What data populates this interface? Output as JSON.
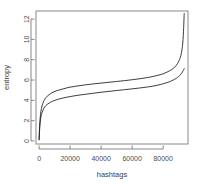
{
  "chart_data": {
    "type": "line",
    "title": "",
    "subtitle": "",
    "xlabel": "hashtags",
    "ylabel": "entropy",
    "grid": false,
    "legend": false,
    "legend_position": "none",
    "xlim": [
      -2000,
      96000
    ],
    "ylim": [
      -0.3,
      12.8
    ],
    "xticks": [
      0,
      20000,
      40000,
      60000,
      80000
    ],
    "xtick_labels": [
      "0",
      "20000",
      "40000",
      "60000",
      "80000"
    ],
    "yticks": [
      0,
      2,
      4,
      6,
      8,
      10,
      12
    ],
    "ytick_labels": [
      "0",
      "2",
      "4",
      "6",
      "8",
      "10",
      "12"
    ],
    "series": [
      {
        "name": "upper-curve",
        "color": "#1a1a1a",
        "x": [
          0,
          200,
          500,
          900,
          1500,
          2400,
          3600,
          5200,
          7200,
          9600,
          12500,
          16000,
          20000,
          25000,
          30000,
          35000,
          40000,
          45000,
          50000,
          55000,
          60000,
          65000,
          70000,
          74000,
          78000,
          81000,
          84000,
          86500,
          88500,
          90000,
          91000,
          91800,
          92400,
          92800,
          93100,
          93300,
          93450,
          93550
        ],
        "y": [
          0.15,
          1.0,
          1.9,
          2.6,
          3.2,
          3.7,
          4.1,
          4.4,
          4.65,
          4.85,
          5.0,
          5.15,
          5.3,
          5.42,
          5.53,
          5.62,
          5.7,
          5.78,
          5.86,
          5.94,
          6.03,
          6.13,
          6.25,
          6.37,
          6.52,
          6.68,
          6.9,
          7.15,
          7.45,
          7.85,
          8.2,
          8.7,
          9.3,
          10.0,
          10.8,
          11.5,
          12.1,
          12.55
        ]
      },
      {
        "name": "lower-curve",
        "color": "#1a1a1a",
        "x": [
          0,
          200,
          500,
          900,
          1500,
          2400,
          3600,
          5200,
          7200,
          9600,
          12500,
          16000,
          20000,
          25000,
          30000,
          35000,
          40000,
          45000,
          50000,
          55000,
          60000,
          65000,
          70000,
          74000,
          78000,
          81000,
          84000,
          86500,
          88500,
          90000,
          91000,
          91800,
          92400,
          92900,
          93300,
          93550
        ],
        "y": [
          0.1,
          0.75,
          1.5,
          2.1,
          2.6,
          3.0,
          3.35,
          3.6,
          3.8,
          3.97,
          4.12,
          4.25,
          4.37,
          4.5,
          4.6,
          4.7,
          4.8,
          4.88,
          4.97,
          5.05,
          5.13,
          5.22,
          5.32,
          5.42,
          5.55,
          5.68,
          5.83,
          6.0,
          6.18,
          6.36,
          6.5,
          6.65,
          6.8,
          6.93,
          7.05,
          7.13
        ]
      }
    ]
  }
}
